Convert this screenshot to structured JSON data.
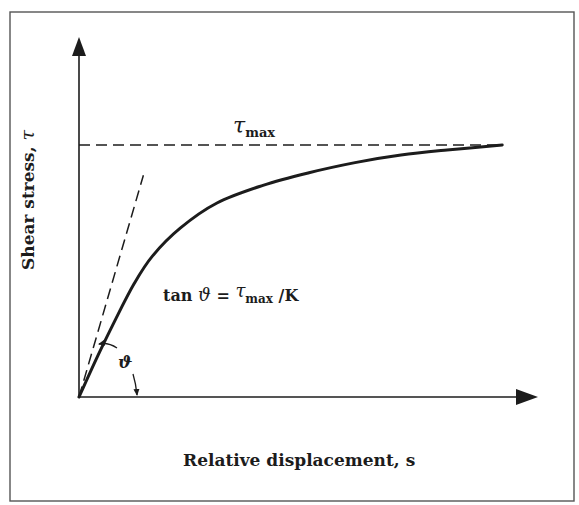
{
  "figure": {
    "y_axis_label": "Shear stress, ",
    "y_axis_symbol": "τ",
    "x_axis_label": "Relative displacement, s",
    "tau_max_label": {
      "symbol": "τ",
      "subscript": "max"
    },
    "equation": {
      "lhs": "tan ",
      "angle_symbol": "ϑ",
      "equals": " = ",
      "tau": "τ",
      "subscript": "max",
      "rhs": " /K"
    },
    "angle_label": "ϑ",
    "colors": {
      "ink": "#1c1c1c",
      "frame": "#555555",
      "background": "#ffffff"
    }
  },
  "chart_data": {
    "type": "line",
    "title": "",
    "xlabel": "Relative displacement, s",
    "ylabel": "Shear stress, τ",
    "x_ticks": [],
    "y_ticks": [],
    "grid": false,
    "xlim": [
      0,
      1
    ],
    "ylim": [
      0,
      1
    ],
    "series": [
      {
        "name": "shear stress curve",
        "style": "solid",
        "description": "Saturating curve rising from origin and approaching τmax asymptotically",
        "x": [
          0,
          0.04,
          0.08,
          0.12,
          0.16,
          0.22,
          0.3,
          0.4,
          0.5,
          0.6,
          0.7,
          0.8,
          0.92
        ],
        "y": [
          0,
          0.16,
          0.31,
          0.45,
          0.56,
          0.67,
          0.77,
          0.84,
          0.89,
          0.93,
          0.96,
          0.98,
          1.0
        ]
      },
      {
        "name": "tau_max asymptote",
        "style": "dashed",
        "x": [
          0,
          0.92
        ],
        "y": [
          1.0,
          1.0
        ]
      },
      {
        "name": "initial tangent (slope K)",
        "style": "dashed",
        "x": [
          0,
          0.14
        ],
        "y": [
          0,
          0.88
        ]
      }
    ],
    "annotations": [
      {
        "text": "τmax",
        "anchor": "above asymptote, center"
      },
      {
        "text": "tan ϑ = τmax / K",
        "anchor": "center-left of plot"
      },
      {
        "text": "ϑ",
        "anchor": "angle between x-axis and initial tangent"
      }
    ]
  }
}
